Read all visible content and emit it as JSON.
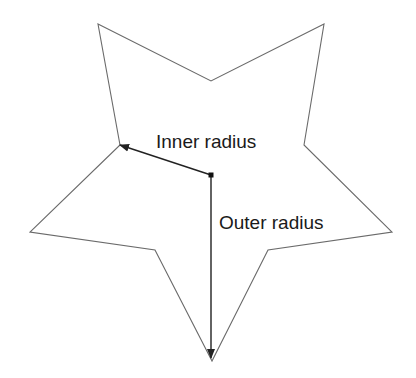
{
  "diagram": {
    "colors": {
      "background": "#ffffff",
      "outline": "#6a6a6a",
      "arrow": "#222222",
      "text": "#1a1a1a"
    },
    "star": {
      "points": 5,
      "center": [
        211,
        175
      ],
      "vertices": [
        [
          98,
          24
        ],
        [
          211,
          81
        ],
        [
          324,
          24
        ],
        [
          304,
          145
        ],
        [
          392,
          232
        ],
        [
          268,
          250
        ],
        [
          212,
          361
        ],
        [
          155,
          250
        ],
        [
          30,
          232
        ],
        [
          120,
          145
        ]
      ]
    },
    "labels": {
      "inner_radius": "Inner radius",
      "outer_radius": "Outer radius"
    },
    "arrows": {
      "inner": {
        "from": [
          211,
          175
        ],
        "to": [
          120,
          145
        ]
      },
      "outer": {
        "from": [
          211,
          175
        ],
        "to": [
          211,
          358
        ]
      }
    }
  }
}
